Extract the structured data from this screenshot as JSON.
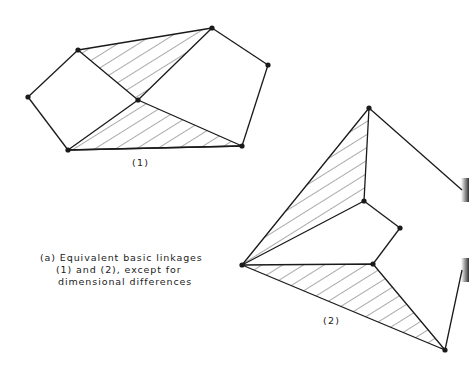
{
  "figure": {
    "title": "Equivalent basic linkages",
    "label_1": "(1)",
    "label_2": "(2)",
    "caption": [
      "(a) Equivalent basic linkages",
      "(1) and (2), except for",
      "dimensional differences"
    ],
    "colors": {
      "line": "#1a1a1a",
      "background": "#ffffff"
    }
  },
  "linkage_1": {
    "joints": [
      [
        78,
        50
      ],
      [
        212,
        28
      ],
      [
        268,
        65
      ],
      [
        28,
        97
      ],
      [
        138,
        100
      ],
      [
        68,
        150
      ],
      [
        242,
        146
      ]
    ],
    "hatched_triangles": [
      [
        [
          78,
          50
        ],
        [
          212,
          28
        ],
        [
          138,
          100
        ]
      ],
      [
        [
          68,
          150
        ],
        [
          138,
          100
        ],
        [
          242,
          146
        ]
      ]
    ],
    "links": [
      [
        [
          28,
          97
        ],
        [
          78,
          50
        ]
      ],
      [
        [
          28,
          97
        ],
        [
          68,
          150
        ]
      ],
      [
        [
          212,
          28
        ],
        [
          268,
          65
        ]
      ],
      [
        [
          268,
          65
        ],
        [
          242,
          146
        ]
      ],
      [
        [
          68,
          150
        ],
        [
          242,
          146
        ]
      ]
    ]
  },
  "linkage_2": {
    "joints": [
      [
        369,
        108
      ],
      [
        364,
        201
      ],
      [
        400,
        228
      ],
      [
        373,
        264
      ],
      [
        242,
        265
      ],
      [
        445,
        350
      ]
    ],
    "hatched_triangles": [
      [
        [
          242,
          265
        ],
        [
          369,
          108
        ],
        [
          364,
          201
        ]
      ],
      [
        [
          242,
          265
        ],
        [
          373,
          264
        ],
        [
          445,
          350
        ]
      ]
    ],
    "links": [
      [
        [
          364,
          201
        ],
        [
          400,
          228
        ]
      ],
      [
        [
          400,
          228
        ],
        [
          373,
          264
        ]
      ],
      [
        [
          369,
          108
        ],
        [
          462,
          190
        ]
      ],
      [
        [
          445,
          350
        ],
        [
          462,
          270
        ]
      ]
    ]
  }
}
